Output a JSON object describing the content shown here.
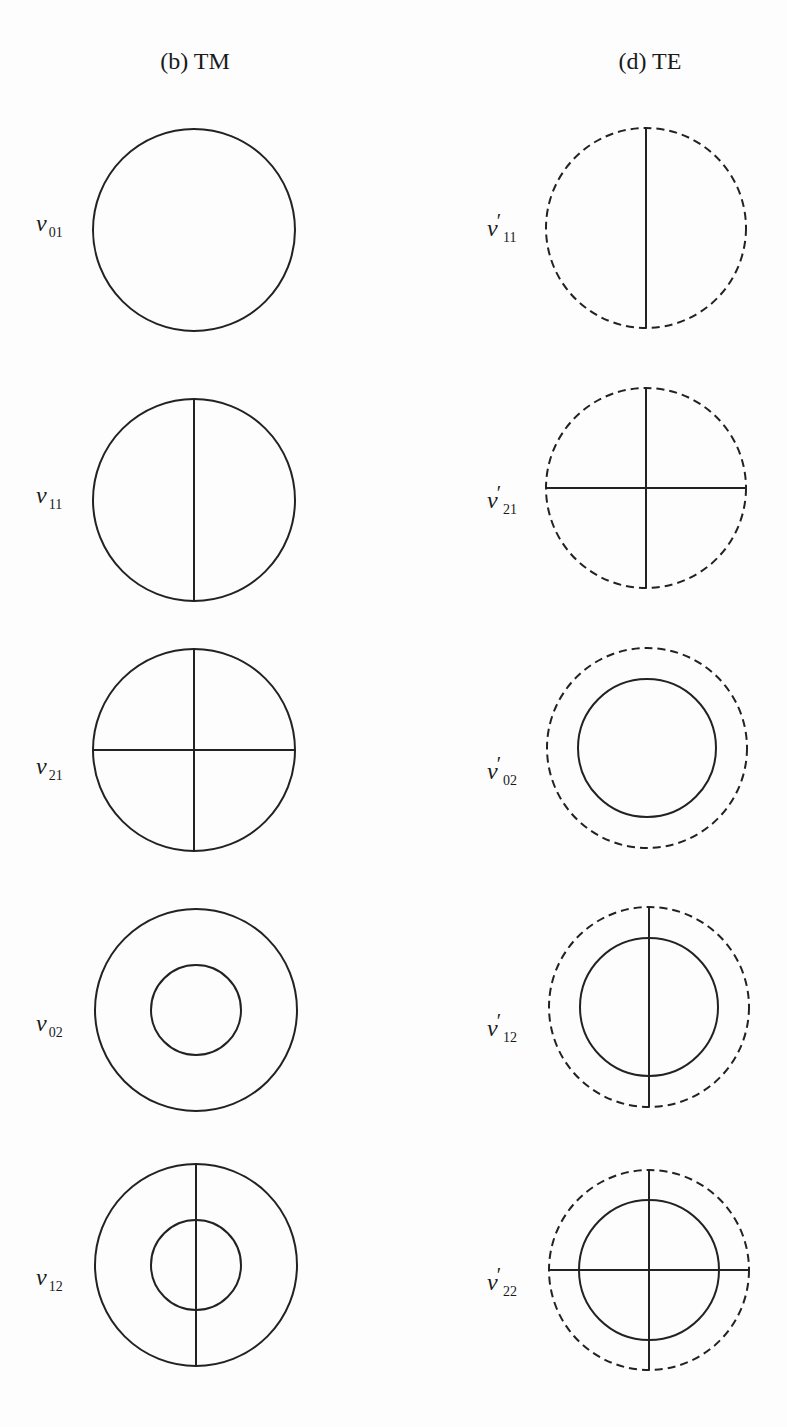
{
  "columns": [
    {
      "title": "(b) TM",
      "modes": [
        {
          "symbol": "v",
          "prime": "",
          "sub": "01"
        },
        {
          "symbol": "v",
          "prime": "",
          "sub": "11"
        },
        {
          "symbol": "v",
          "prime": "",
          "sub": "21"
        },
        {
          "symbol": "v",
          "prime": "",
          "sub": "02"
        },
        {
          "symbol": "v",
          "prime": "",
          "sub": "12"
        }
      ]
    },
    {
      "title": "(d) TE",
      "modes": [
        {
          "symbol": "v",
          "prime": "′",
          "sub": "11"
        },
        {
          "symbol": "v",
          "prime": "′",
          "sub": "21"
        },
        {
          "symbol": "v",
          "prime": "′",
          "sub": "02"
        },
        {
          "symbol": "v",
          "prime": "′",
          "sub": "12"
        },
        {
          "symbol": "v",
          "prime": "′",
          "sub": "22"
        }
      ]
    }
  ],
  "colors": {
    "stroke": "#222222",
    "background": "#fdfdfd"
  }
}
